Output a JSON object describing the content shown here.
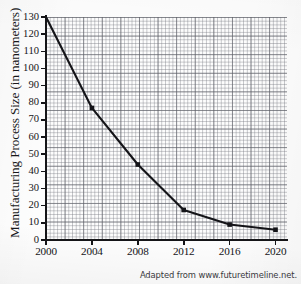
{
  "figure": {
    "title": "",
    "attribution": "Adapted from www.futuretimeline.net.",
    "background_color": "#fdfdfd",
    "line_color": "#141418",
    "grid_color": "#787a82",
    "axis_color": "#151518"
  },
  "chart_data": {
    "type": "line",
    "title": "",
    "xlabel": "",
    "ylabel": "Manufacturing Process Size (in nanometers)",
    "x": [
      2000,
      2004,
      2008,
      2012,
      2016,
      2020
    ],
    "values": [
      130,
      77,
      44,
      17.5,
      9,
      6
    ],
    "categories": [
      "2000",
      "2004",
      "2008",
      "2012",
      "2016",
      "2020"
    ],
    "series": [
      {
        "name": "Manufacturing Process Size",
        "values": [
          130,
          77,
          44,
          17.5,
          9,
          6
        ]
      }
    ],
    "xlim": [
      2000,
      2021
    ],
    "ylim": [
      0,
      130
    ],
    "xticks": [
      2000,
      2004,
      2008,
      2012,
      2016,
      2020
    ],
    "xtick_labels": [
      "2000",
      "2004",
      "2008",
      "2012",
      "2016",
      "2020"
    ],
    "yticks": [
      0,
      10,
      20,
      30,
      40,
      50,
      60,
      70,
      80,
      90,
      100,
      110,
      120,
      130
    ],
    "ytick_labels": [
      "0",
      "10",
      "20",
      "30",
      "40",
      "50",
      "60",
      "70",
      "80",
      "90",
      "100",
      "110",
      "120",
      "130"
    ],
    "grid": true,
    "grid_style": "graph-paper-fine-and-major",
    "legend": false,
    "legend_position": "none",
    "marker": "square",
    "annotations": [
      "Adapted from www.futuretimeline.net."
    ]
  }
}
